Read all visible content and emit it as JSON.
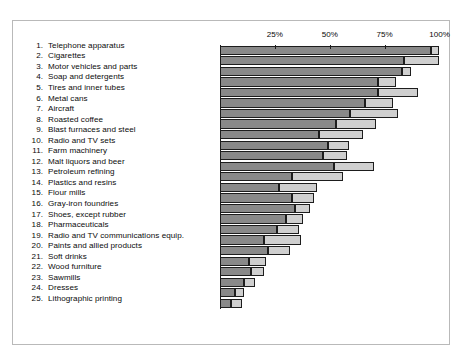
{
  "chart_data": {
    "type": "bar",
    "orientation": "horizontal",
    "stacked": true,
    "title": "",
    "subtitle": "",
    "xlabel": "",
    "ylabel": "",
    "xlim": [
      0,
      105
    ],
    "grid": false,
    "legend_position": "none",
    "axis_ticks": [
      {
        "value": 25,
        "label": "25%"
      },
      {
        "value": 50,
        "label": "50%"
      },
      {
        "value": 75,
        "label": "75%"
      },
      {
        "value": 100,
        "label": "100%"
      }
    ],
    "colors": {
      "segment_dark": "#898989",
      "segment_light": "#cfcfcf",
      "outline": "#1d1d1d",
      "frame": "#b9b9b9",
      "text": "#0b0b0b",
      "background": "#ffffff"
    },
    "series": [
      {
        "name": "Top 4 firms",
        "key": "dark"
      },
      {
        "name": "Next 4 firms",
        "key": "light"
      }
    ],
    "categories": [
      "Telephone apparatus",
      "Cigarettes",
      "Motor vehicles and parts",
      "Soap and detergents",
      "Tires and inner tubes",
      "Metal cans",
      "Aircraft",
      "Roasted coffee",
      "Blast furnaces and steel",
      "Radio and TV sets",
      "Farm machinery",
      "Malt liquors and beer",
      "Petroleum refining",
      "Plastics and resins",
      "Flour mills",
      "Gray-iron foundries",
      "Shoes, except rubber",
      "Pharmaceuticals",
      "Radio and TV communications equip.",
      "Paints and allied products",
      "Soft drinks",
      "Wood furniture",
      "Sawmills",
      "Dresses",
      "Lithographic printing"
    ],
    "rows": [
      {
        "rank": "1.",
        "label": "Telephone apparatus",
        "dark": 96,
        "light": 4,
        "total": 100
      },
      {
        "rank": "2.",
        "label": "Cigarettes",
        "dark": 84,
        "light": 16,
        "total": 100
      },
      {
        "rank": "3.",
        "label": "Motor vehicles and parts",
        "dark": 83,
        "light": 4,
        "total": 87
      },
      {
        "rank": "4.",
        "label": "Soap and detergents",
        "dark": 72,
        "light": 8,
        "total": 80
      },
      {
        "rank": "5.",
        "label": "Tires and inner tubes",
        "dark": 72,
        "light": 18,
        "total": 90
      },
      {
        "rank": "6.",
        "label": "Metal cans",
        "dark": 66,
        "light": 13,
        "total": 79
      },
      {
        "rank": "7.",
        "label": "Aircraft",
        "dark": 59,
        "light": 22,
        "total": 81
      },
      {
        "rank": "8.",
        "label": "Roasted coffee",
        "dark": 53,
        "light": 18,
        "total": 71
      },
      {
        "rank": "9.",
        "label": "Blast furnaces and steel",
        "dark": 45,
        "light": 20,
        "total": 65
      },
      {
        "rank": "10.",
        "label": "Radio and TV sets",
        "dark": 49,
        "light": 10,
        "total": 59
      },
      {
        "rank": "11.",
        "label": "Farm machinery",
        "dark": 47,
        "light": 11,
        "total": 58
      },
      {
        "rank": "12.",
        "label": "Malt liquors and beer",
        "dark": 52,
        "light": 18,
        "total": 70
      },
      {
        "rank": "13.",
        "label": "Petroleum refining",
        "dark": 33,
        "light": 23,
        "total": 56
      },
      {
        "rank": "14.",
        "label": "Plastics and resins",
        "dark": 27,
        "light": 17,
        "total": 44
      },
      {
        "rank": "15.",
        "label": "Flour mills",
        "dark": 33,
        "light": 10,
        "total": 43
      },
      {
        "rank": "16.",
        "label": "Gray-iron foundries",
        "dark": 34,
        "light": 7,
        "total": 41
      },
      {
        "rank": "17.",
        "label": "Shoes, except rubber",
        "dark": 30,
        "light": 8,
        "total": 38
      },
      {
        "rank": "18.",
        "label": "Pharmaceuticals",
        "dark": 26,
        "light": 10,
        "total": 36
      },
      {
        "rank": "19.",
        "label": "Radio and TV communications equip.",
        "dark": 20,
        "light": 17,
        "total": 37
      },
      {
        "rank": "20.",
        "label": "Paints and allied products",
        "dark": 22,
        "light": 10,
        "total": 32
      },
      {
        "rank": "21.",
        "label": "Soft drinks",
        "dark": 13,
        "light": 8,
        "total": 21
      },
      {
        "rank": "22.",
        "label": "Wood furniture",
        "dark": 14,
        "light": 6,
        "total": 20
      },
      {
        "rank": "23.",
        "label": "Sawmills",
        "dark": 11,
        "light": 5,
        "total": 16
      },
      {
        "rank": "24.",
        "label": "Dresses",
        "dark": 7,
        "light": 4,
        "total": 11
      },
      {
        "rank": "25.",
        "label": "Lithographic printing",
        "dark": 5,
        "light": 5,
        "total": 10
      }
    ]
  }
}
